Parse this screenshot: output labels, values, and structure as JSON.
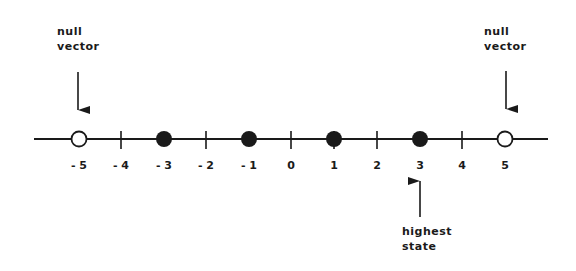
{
  "diagram": {
    "type": "number-line",
    "axis": {
      "min": -5,
      "max": 5,
      "ticks": [
        "- 5",
        "- 4",
        "- 3",
        "- 2",
        "- 1",
        "0",
        "1",
        "2",
        "3",
        "4",
        "5"
      ]
    },
    "points": [
      {
        "value": -5,
        "style": "open"
      },
      {
        "value": -3,
        "style": "filled"
      },
      {
        "value": -1,
        "style": "filled"
      },
      {
        "value": 1,
        "style": "filled"
      },
      {
        "value": 3,
        "style": "filled"
      },
      {
        "value": 5,
        "style": "open"
      }
    ],
    "annotations": {
      "left": {
        "line1": "null",
        "line2": "vector",
        "points_to": -5,
        "arrow": "down"
      },
      "right": {
        "line1": "null",
        "line2": "vector",
        "points_to": 5,
        "arrow": "down"
      },
      "bottom": {
        "line1": "highest",
        "line2": "state",
        "points_to": 3,
        "arrow": "up"
      }
    },
    "colors": {
      "ink": "#1a1a1a",
      "background": "#ffffff"
    }
  }
}
